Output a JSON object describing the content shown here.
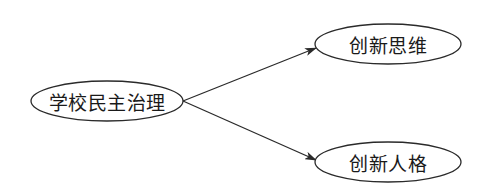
{
  "diagram": {
    "type": "concept-map",
    "colors": {
      "stroke": "#2a2a2a",
      "text": "#1a1a1a",
      "background": "#ffffff"
    },
    "nodes": [
      {
        "id": "root",
        "label": "学校民主治理",
        "cx": 107,
        "cy": 101,
        "rx": 76,
        "ry": 20
      },
      {
        "id": "top",
        "label": "创新思维",
        "cx": 388,
        "cy": 44,
        "rx": 73,
        "ry": 20
      },
      {
        "id": "bottom",
        "label": "创新人格",
        "cx": 388,
        "cy": 162,
        "rx": 73,
        "ry": 20
      }
    ],
    "edges": [
      {
        "from": "root",
        "to": "top",
        "x1": 183,
        "y1": 101,
        "x2": 316,
        "y2": 48
      },
      {
        "from": "root",
        "to": "bottom",
        "x1": 183,
        "y1": 101,
        "x2": 316,
        "y2": 160
      }
    ]
  }
}
